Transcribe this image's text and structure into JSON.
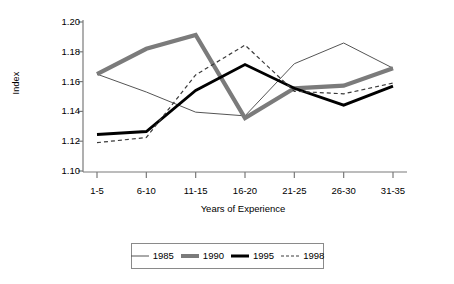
{
  "chart_data": {
    "type": "line",
    "title": "",
    "xlabel": "Years of Experience",
    "ylabel": "Index",
    "categories": [
      "1-5",
      "6-10",
      "11-15",
      "16-20",
      "21-25",
      "26-30",
      "31-35"
    ],
    "ylim": [
      1.1,
      1.2
    ],
    "yticks": [
      "1.20",
      "1.18",
      "1.16",
      "1.14",
      "1.12",
      "1.10"
    ],
    "ytick_values": [
      1.2,
      1.18,
      1.16,
      1.14,
      1.12,
      1.1
    ],
    "grid": false,
    "legend_position": "bottom",
    "series": [
      {
        "name": "1985",
        "style": "thin-solid",
        "color": "#555555",
        "values": [
          1.165,
          1.153,
          1.1395,
          1.137,
          1.172,
          1.1859,
          1.169
        ]
      },
      {
        "name": "1990",
        "style": "thick-gray-solid",
        "color": "#7b7b7b",
        "values": [
          1.165,
          1.182,
          1.1913,
          1.1355,
          1.1555,
          1.1573,
          1.169
        ]
      },
      {
        "name": "1995",
        "style": "thick-black-solid",
        "color": "#000000",
        "values": [
          1.1245,
          1.1265,
          1.154,
          1.1715,
          1.1555,
          1.1442,
          1.157
        ]
      },
      {
        "name": "1998",
        "style": "dashed",
        "color": "#3a3a3a",
        "values": [
          1.119,
          1.1225,
          1.1645,
          1.1845,
          1.1535,
          1.1518,
          1.159
        ]
      }
    ]
  },
  "axes": {
    "y_label": "Index",
    "x_label": "Years of Experience"
  },
  "legend": {
    "entries": [
      {
        "label": "1985"
      },
      {
        "label": "1990"
      },
      {
        "label": "1995"
      },
      {
        "label": "1998"
      }
    ]
  },
  "colors": {
    "axis": "#7a7a7a",
    "series_1985": "#555555",
    "series_1990": "#7b7b7b",
    "series_1995": "#000000",
    "series_1998": "#3a3a3a",
    "legend_border": "#8a8a8a",
    "background": "#ffffff"
  }
}
